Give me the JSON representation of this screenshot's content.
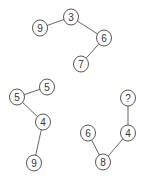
{
  "diagram": {
    "width": 146,
    "height": 183,
    "node_radius": 8,
    "trees": [
      {
        "name": "tree-top",
        "nodes": [
          {
            "id": "t1",
            "label": "9",
            "x": 40,
            "y": 28
          },
          {
            "id": "t2",
            "label": "3",
            "x": 71,
            "y": 17
          },
          {
            "id": "t3",
            "label": "6",
            "x": 104,
            "y": 38
          },
          {
            "id": "t4",
            "label": "7",
            "x": 81,
            "y": 64
          }
        ],
        "edges": [
          [
            "t1",
            "t2"
          ],
          [
            "t2",
            "t3"
          ],
          [
            "t3",
            "t4"
          ]
        ]
      },
      {
        "name": "tree-bottom-left",
        "nodes": [
          {
            "id": "l1",
            "label": "5",
            "x": 47,
            "y": 87
          },
          {
            "id": "l2",
            "label": "5",
            "x": 17,
            "y": 97
          },
          {
            "id": "l3",
            "label": "4",
            "x": 43,
            "y": 122
          },
          {
            "id": "l4",
            "label": "9",
            "x": 34,
            "y": 163
          }
        ],
        "edges": [
          [
            "l2",
            "l1"
          ],
          [
            "l2",
            "l3"
          ],
          [
            "l3",
            "l4"
          ]
        ]
      },
      {
        "name": "tree-bottom-right",
        "nodes": [
          {
            "id": "r1",
            "label": "?",
            "x": 128,
            "y": 98
          },
          {
            "id": "r2",
            "label": "4",
            "x": 128,
            "y": 133
          },
          {
            "id": "r3",
            "label": "6",
            "x": 88,
            "y": 133
          },
          {
            "id": "r4",
            "label": "8",
            "x": 103,
            "y": 162
          }
        ],
        "edges": [
          [
            "r1",
            "r2"
          ],
          [
            "r2",
            "r4"
          ],
          [
            "r3",
            "r4"
          ]
        ]
      }
    ]
  }
}
